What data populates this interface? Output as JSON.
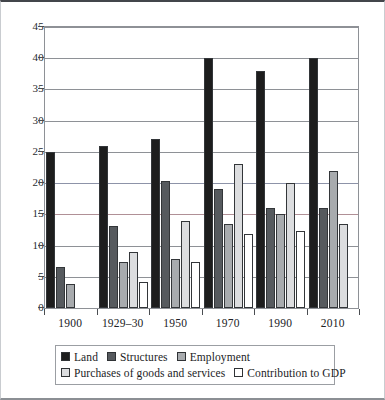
{
  "chart_data": {
    "type": "bar",
    "title": "",
    "subtitle": "",
    "xlabel": "",
    "ylabel": "",
    "ylim": [
      0,
      45
    ],
    "yticks": [
      0,
      5,
      10,
      15,
      20,
      25,
      30,
      35,
      40,
      45
    ],
    "grid": true,
    "legend_position": "bottom",
    "categories": [
      "1900",
      "1929–30",
      "1950",
      "1970",
      "1990",
      "2010"
    ],
    "series": [
      {
        "name": "Land",
        "color": "#1d1d1d",
        "values": [
          25,
          26,
          27,
          40,
          38,
          40
        ]
      },
      {
        "name": "Structures",
        "color": "#565a5e",
        "values": [
          6.6,
          13.2,
          20.4,
          19.1,
          16,
          16
        ]
      },
      {
        "name": "Employment",
        "color": "#a8abae",
        "values": [
          3.9,
          7.4,
          7.9,
          13.4,
          15,
          22
        ]
      },
      {
        "name": "Purchases of goods and services",
        "color": "#dcdddf",
        "values": [
          null,
          9,
          14,
          23,
          20,
          13.5
        ]
      },
      {
        "name": "Contribution to GDP",
        "color": "#ffffff",
        "values": [
          null,
          4.1,
          7.3,
          11.8,
          12.4,
          null
        ]
      }
    ]
  },
  "axis": {
    "ytick_labels": [
      "45",
      "40",
      "35",
      "30",
      "25",
      "20",
      "15",
      "10",
      "5",
      "0"
    ],
    "xtick_labels": [
      "1900",
      "1929–30",
      "1950",
      "1970",
      "1990",
      "2010"
    ]
  },
  "legend": {
    "row1": [
      {
        "label": "Land",
        "color": "#1d1d1d"
      },
      {
        "label": "Structures",
        "color": "#565a5e"
      },
      {
        "label": "Employment",
        "color": "#a8abae"
      }
    ],
    "row2": [
      {
        "label": "Purchases of goods and services",
        "color": "#dcdddf"
      },
      {
        "label": "Contribution to GDP",
        "color": "#ffffff"
      }
    ]
  },
  "colors": {
    "land": "#1d1d1d",
    "structures": "#565a5e",
    "employment": "#a8abae",
    "purchases": "#dcdddf",
    "contribution": "#ffffff",
    "axis": "#8e9196",
    "text": "#1b1c1e"
  }
}
